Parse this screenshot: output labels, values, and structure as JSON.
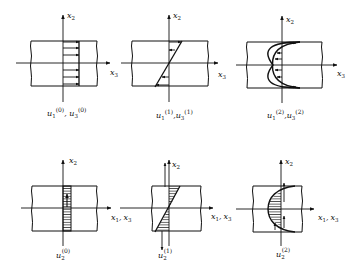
{
  "figure": {
    "colors": {
      "ink": "#111111",
      "background": "#ffffff"
    }
  },
  "top_row": {
    "axis_vertical": "x2",
    "axis_horizontal": "x3",
    "panels": [
      {
        "id": "order-0",
        "profile": "uniform",
        "label_main": "u",
        "label": "u1(0), u3(0)",
        "parts": [
          {
            "base": "u",
            "sub": "1",
            "sup": "(0)"
          },
          {
            "base": "u",
            "sub": "3",
            "sup": "(0)"
          }
        ]
      },
      {
        "id": "order-1",
        "profile": "linear",
        "label": "u1(1), u3(1)",
        "parts": [
          {
            "base": "u",
            "sub": "1",
            "sup": "(1)"
          },
          {
            "base": "u",
            "sub": "3",
            "sup": "(1)"
          }
        ]
      },
      {
        "id": "order-2",
        "profile": "parabolic",
        "label": "u1(2), u3(2)",
        "parts": [
          {
            "base": "u",
            "sub": "1",
            "sup": "(2)"
          },
          {
            "base": "u",
            "sub": "3",
            "sup": "(2)"
          }
        ]
      }
    ]
  },
  "bottom_row": {
    "axis_vertical": "x2",
    "axis_horizontal": "x1, x3",
    "panels": [
      {
        "id": "order-0",
        "profile": "uniform",
        "label": "u2(0)",
        "parts": [
          {
            "base": "u",
            "sub": "2",
            "sup": "(0)"
          }
        ]
      },
      {
        "id": "order-1",
        "profile": "linear",
        "label": "u2(1)",
        "parts": [
          {
            "base": "u",
            "sub": "2",
            "sup": "(1)"
          }
        ]
      },
      {
        "id": "order-2",
        "profile": "parabolic",
        "label": "u2(2)",
        "parts": [
          {
            "base": "u",
            "sub": "2",
            "sup": "(2)"
          }
        ]
      }
    ]
  },
  "text": {
    "x": "x",
    "u": "u",
    "sub1": "1",
    "sub2": "2",
    "sub3": "3",
    "sup0": "(0)",
    "sup1": "(1)",
    "sup2": "(2)",
    "comma": ",",
    "comma_sp": ", "
  }
}
